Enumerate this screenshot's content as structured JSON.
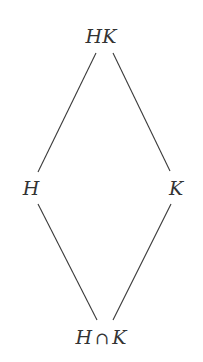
{
  "diagram": {
    "type": "lattice",
    "nodes": [
      {
        "id": "HK",
        "label": "HK",
        "x": 101,
        "y": 36
      },
      {
        "id": "H",
        "label": "H",
        "x": 31,
        "y": 188
      },
      {
        "id": "K",
        "label": "K",
        "x": 176,
        "y": 188
      },
      {
        "id": "HcapK",
        "label_left": "H",
        "label_op": "∩",
        "label_right": "K",
        "x": 101,
        "y": 337
      }
    ],
    "edges": [
      {
        "from": "HK",
        "to": "H",
        "x1": 96,
        "y1": 53,
        "x2": 38,
        "y2": 172
      },
      {
        "from": "HK",
        "to": "K",
        "x1": 113,
        "y1": 53,
        "x2": 170,
        "y2": 171
      },
      {
        "from": "H",
        "to": "HcapK",
        "x1": 38,
        "y1": 204,
        "x2": 97,
        "y2": 320
      },
      {
        "from": "K",
        "to": "HcapK",
        "x1": 171,
        "y1": 204,
        "x2": 113,
        "y2": 320
      }
    ],
    "line_color": "#3a3a3a",
    "text_color": "#333333"
  }
}
